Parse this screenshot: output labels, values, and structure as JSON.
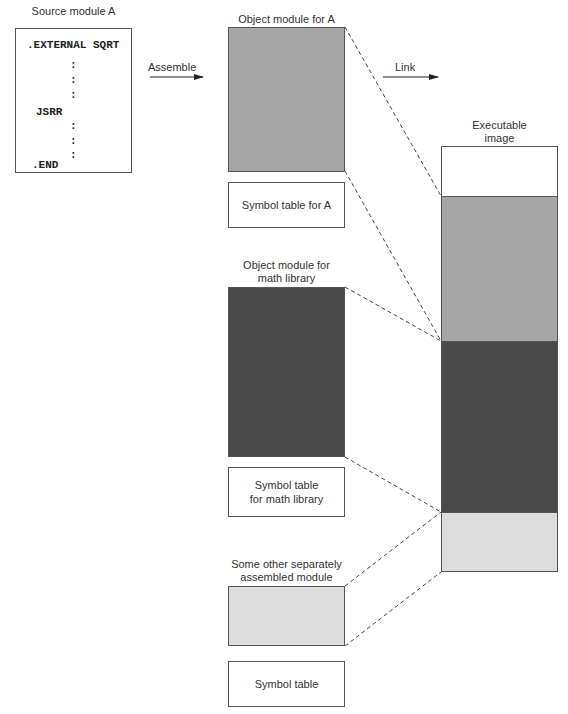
{
  "source": {
    "title": "Source module A",
    "lines": [
      ".EXTERNAL SQRT",
      ":",
      ":",
      ":",
      "JSRR",
      ":",
      ":",
      ":",
      ".END"
    ]
  },
  "arrows": {
    "assemble": "Assemble",
    "link": "Link"
  },
  "object_a": {
    "title": "Object module for A",
    "symbol_table": "Symbol table for A",
    "color": "#a6a6a6"
  },
  "math_lib": {
    "title_line1": "Object module for",
    "title_line2": "math library",
    "symbol_table_line1": "Symbol table",
    "symbol_table_line2": "for math library",
    "color": "#4a4a4a"
  },
  "other": {
    "title_line1": "Some other separately",
    "title_line2": "assembled module",
    "symbol_table": "Symbol table",
    "color": "#dcdcdc"
  },
  "executable": {
    "title_line1": "Executable",
    "title_line2": "image",
    "segments": [
      {
        "name": "header",
        "color": "#ffffff"
      },
      {
        "name": "module-a",
        "color": "#a6a6a6"
      },
      {
        "name": "math-library",
        "color": "#4a4a4a"
      },
      {
        "name": "other-module",
        "color": "#dcdcdc"
      }
    ]
  }
}
